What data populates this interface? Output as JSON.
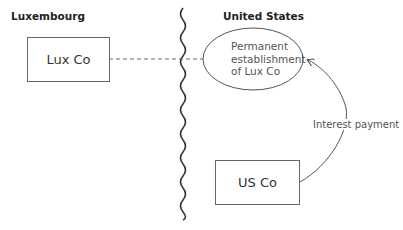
{
  "diagram": {
    "regions": [
      {
        "id": "luxembourg",
        "label": "Luxembourg"
      },
      {
        "id": "united-states",
        "label": "United States"
      }
    ],
    "nodes": {
      "lux_co": {
        "label": "Lux Co",
        "shape": "rectangle",
        "region": "luxembourg"
      },
      "permanent_establishment": {
        "label_lines": [
          "Permanent",
          "establishment",
          "of Lux Co"
        ],
        "shape": "ellipse",
        "region": "united-states"
      },
      "us_co": {
        "label": "US Co",
        "shape": "rectangle",
        "region": "united-states"
      }
    },
    "edges": [
      {
        "from": "lux_co",
        "to": "permanent_establishment",
        "style": "dashed",
        "label": ""
      },
      {
        "from": "us_co",
        "to": "permanent_establishment",
        "style": "curved-arrow",
        "label": "Interest payment"
      }
    ],
    "border": {
      "style": "wavy",
      "separates": [
        "luxembourg",
        "united-states"
      ]
    }
  }
}
